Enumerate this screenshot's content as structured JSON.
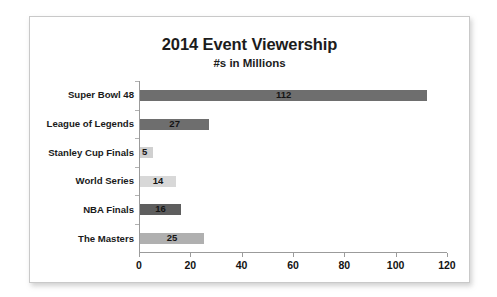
{
  "chart_data": {
    "type": "bar",
    "orientation": "horizontal",
    "title": "2014 Event Viewership",
    "subtitle": "#s in Millions",
    "xlabel": "",
    "ylabel": "",
    "xlim": [
      0,
      120
    ],
    "xticks": [
      "0",
      "20",
      "40",
      "60",
      "80",
      "100",
      "120"
    ],
    "grid": false,
    "legend": "none",
    "categories": [
      "Super Bowl 48",
      "League of Legends",
      "Stanley Cup Finals",
      "World Series",
      "NBA Finals",
      "The Masters"
    ],
    "values": [
      112,
      27,
      5,
      14,
      16,
      25
    ],
    "value_labels": [
      "112",
      "27",
      "5",
      "14",
      "16",
      "25"
    ],
    "bar_colors": [
      "#6e6e6e",
      "#6e6e6e",
      "#d0d0d0",
      "#d8d8d8",
      "#5e5e5e",
      "#b0b0b0"
    ]
  },
  "colors": {
    "card_background": "#ffffff",
    "card_border": "#c9c9c9",
    "axis": "#9b9b9b",
    "text": "#1a1a1a"
  }
}
